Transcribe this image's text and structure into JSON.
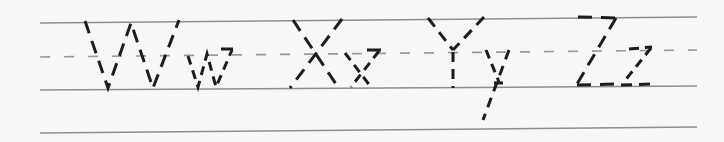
{
  "worksheet": {
    "description": "Handwriting tracing practice row with dashed guide letters",
    "letter_pairs": [
      "Ww",
      "Xx",
      "Yy",
      "Zz"
    ],
    "colors": {
      "paper": "#f7f7f5",
      "guide_line": "#8e8e8e",
      "midline": "#9a9a9a",
      "ink": "#1d1d1d"
    },
    "guides": {
      "lines": [
        {
          "id": "top-line",
          "x1": 40,
          "y1": 23,
          "x2": 697,
          "y2": 17,
          "style": "solid",
          "width": 1.5
        },
        {
          "id": "mid-line",
          "x1": 40,
          "y1": 57,
          "x2": 697,
          "y2": 50,
          "style": "dashed",
          "width": 1.7,
          "dash": "10 14"
        },
        {
          "id": "base-line",
          "x1": 40,
          "y1": 90,
          "x2": 697,
          "y2": 86,
          "style": "solid",
          "width": 1.5
        },
        {
          "id": "bottom-line",
          "x1": 40,
          "y1": 133,
          "x2": 697,
          "y2": 127,
          "style": "solid",
          "width": 1.5
        }
      ]
    },
    "letters": [
      {
        "char": "W",
        "case": "uppercase",
        "strokes": [
          {
            "points": [
              [
                85,
                21
              ],
              [
                108,
                88
              ],
              [
                131,
                23
              ],
              [
                153,
                88
              ],
              [
                179,
                20
              ]
            ],
            "dash": "13 8"
          }
        ]
      },
      {
        "char": "w",
        "case": "lowercase",
        "strokes": [
          {
            "points": [
              [
                188,
                56
              ],
              [
                198,
                87
              ],
              [
                207,
                54
              ],
              [
                216,
                87
              ],
              [
                232,
                50
              ]
            ],
            "dash": "9 6"
          },
          {
            "points": [
              [
                221,
                49
              ],
              [
                233,
                49
              ]
            ],
            "dash": "12 1"
          }
        ]
      },
      {
        "char": "X",
        "case": "uppercase",
        "strokes": [
          {
            "points": [
              [
                293,
                20
              ],
              [
                338,
                87
              ]
            ],
            "dash": "13 8"
          },
          {
            "points": [
              [
                342,
                19
              ],
              [
                290,
                88
              ]
            ],
            "dash": "13 8"
          }
        ]
      },
      {
        "char": "x",
        "case": "lowercase",
        "strokes": [
          {
            "points": [
              [
                345,
                53
              ],
              [
                371,
                87
              ]
            ],
            "dash": "9 6"
          },
          {
            "points": [
              [
                379,
                51
              ],
              [
                351,
                87
              ]
            ],
            "dash": "9 6"
          },
          {
            "points": [
              [
                367,
                50
              ],
              [
                381,
                50
              ]
            ],
            "dash": "14 1"
          }
        ]
      },
      {
        "char": "Y",
        "case": "uppercase",
        "strokes": [
          {
            "points": [
              [
                428,
                18
              ],
              [
                453,
                50
              ]
            ],
            "dash": "11 7"
          },
          {
            "points": [
              [
                484,
                17
              ],
              [
                453,
                50
              ]
            ],
            "dash": "11 7"
          },
          {
            "points": [
              [
                453,
                52
              ],
              [
                453,
                88
              ]
            ],
            "dash": "10 7"
          }
        ]
      },
      {
        "char": "y",
        "case": "lowercase",
        "strokes": [
          {
            "points": [
              [
                486,
                50
              ],
              [
                499,
                82
              ]
            ],
            "dash": "9 6"
          },
          {
            "points": [
              [
                509,
                50
              ],
              [
                483,
                120
              ]
            ],
            "dash": "10 7"
          },
          {
            "points": [
              [
                494,
                83
              ],
              [
                503,
                83
              ]
            ],
            "dash": "9 1"
          }
        ]
      },
      {
        "char": "Z",
        "case": "uppercase",
        "strokes": [
          {
            "points": [
              [
                578,
                17
              ],
              [
                617,
                18
              ]
            ],
            "dash": "14 9"
          },
          {
            "points": [
              [
                616,
                18
              ],
              [
                577,
                84
              ]
            ],
            "dash": "13 8"
          },
          {
            "points": [
              [
                577,
                85
              ],
              [
                618,
                84
              ]
            ],
            "dash": "14 9"
          }
        ]
      },
      {
        "char": "z",
        "case": "lowercase",
        "strokes": [
          {
            "points": [
              [
                629,
                49
              ],
              [
                652,
                47
              ]
            ],
            "dash": "10 6"
          },
          {
            "points": [
              [
                651,
                48
              ],
              [
                623,
                83
              ]
            ],
            "dash": "9 6"
          },
          {
            "points": [
              [
                621,
                85
              ],
              [
                653,
                84
              ]
            ],
            "dash": "11 7"
          }
        ]
      }
    ]
  }
}
